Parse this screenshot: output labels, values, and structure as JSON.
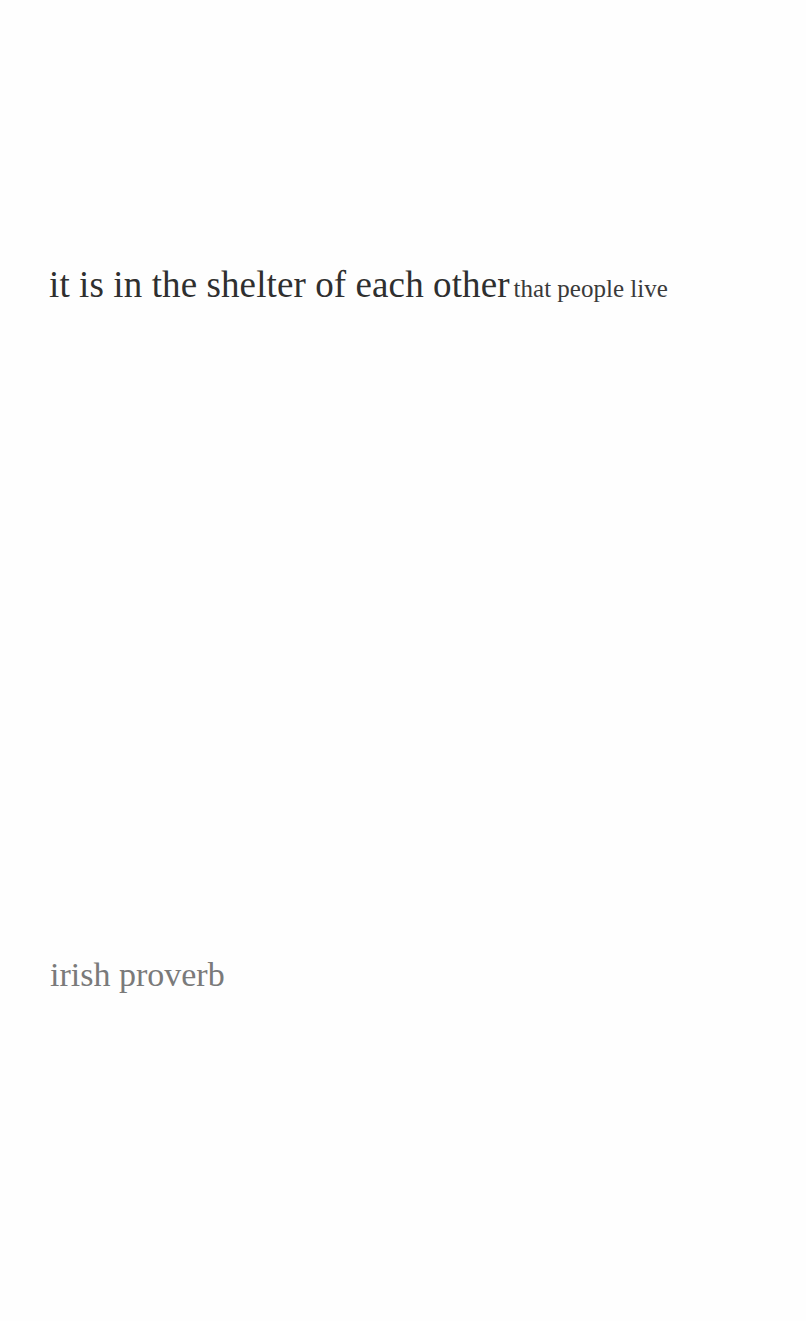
{
  "quote": {
    "emphasized": "it is in the shelter of each other",
    "trailing": "that people live"
  },
  "attribution": "irish proverb",
  "colors": {
    "background": "#fefefe",
    "quote_text": "#2f2f2f",
    "attribution_text": "#7a7a7a"
  }
}
